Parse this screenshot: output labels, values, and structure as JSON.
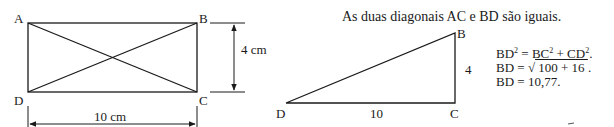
{
  "rectangle": {
    "vertices": {
      "A": "A",
      "B": "B",
      "C": "C",
      "D": "D"
    },
    "height_label": "4 cm",
    "width_label": "10 cm"
  },
  "caption": "As duas diagonais AC e BD são iguais.",
  "triangle": {
    "vertices": {
      "B": "B",
      "C": "C",
      "D": "D"
    },
    "side_bc": "4",
    "side_dc": "10"
  },
  "equations": {
    "line1": {
      "a": "BD",
      "a_exp": "2",
      "eq": " = BC",
      "b_exp": "2",
      "plus": " + CD",
      "c_exp": "2",
      "end": "."
    },
    "line2": {
      "lhs": "BD = ",
      "root_sign": "√",
      "radicand": " 100 + 16 ",
      "end": "."
    },
    "line3": "BD = 10,77."
  },
  "colors": {
    "stroke": "#1a1a1a",
    "background": "#ffffff"
  }
}
